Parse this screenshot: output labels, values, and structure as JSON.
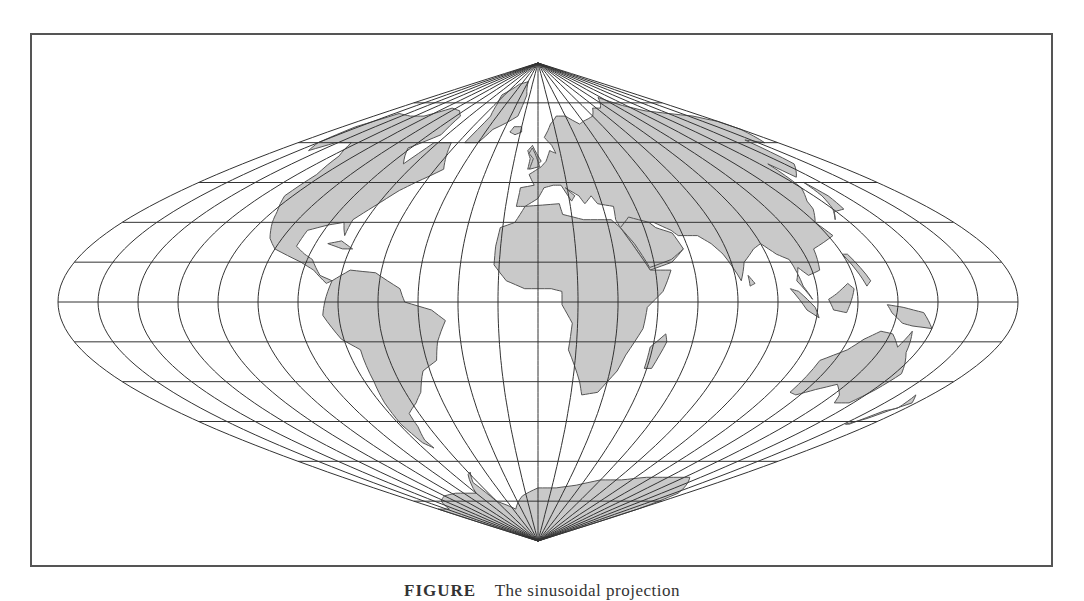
{
  "figure": {
    "projection": "sinusoidal",
    "caption_label": "FIGURE",
    "caption_text": "The sinusoidal projection"
  },
  "map": {
    "center_x": 538,
    "equator_y": 302,
    "half_width": 480,
    "half_height": 239,
    "graticule_step_deg": 15,
    "colors": {
      "background": "#ffffff",
      "land_fill": "#c9c9c9",
      "land_stroke": "#555555",
      "graticule": "#333333",
      "frame": "#555555"
    }
  },
  "continents": [
    {
      "name": "north-america",
      "coords": [
        [
          -168,
          66
        ],
        [
          -160,
          71
        ],
        [
          -140,
          70
        ],
        [
          -125,
          70
        ],
        [
          -110,
          73
        ],
        [
          -95,
          72
        ],
        [
          -85,
          70
        ],
        [
          -80,
          63
        ],
        [
          -92,
          58
        ],
        [
          -82,
          52
        ],
        [
          -78,
          60
        ],
        [
          -65,
          60
        ],
        [
          -60,
          55
        ],
        [
          -55,
          50
        ],
        [
          -65,
          45
        ],
        [
          -70,
          42
        ],
        [
          -76,
          36
        ],
        [
          -81,
          31
        ],
        [
          -80,
          25
        ],
        [
          -84,
          30
        ],
        [
          -90,
          29
        ],
        [
          -97,
          27
        ],
        [
          -97,
          21
        ],
        [
          -92,
          18
        ],
        [
          -88,
          16
        ],
        [
          -83,
          10
        ],
        [
          -78,
          8
        ],
        [
          -80,
          7
        ],
        [
          -86,
          12
        ],
        [
          -92,
          15
        ],
        [
          -105,
          20
        ],
        [
          -110,
          24
        ],
        [
          -115,
          30
        ],
        [
          -118,
          34
        ],
        [
          -124,
          40
        ],
        [
          -124,
          48
        ],
        [
          -130,
          55
        ],
        [
          -140,
          60
        ],
        [
          -152,
          60
        ],
        [
          -158,
          57
        ],
        [
          -165,
          60
        ],
        [
          -168,
          66
        ]
      ]
    },
    {
      "name": "greenland",
      "coords": [
        [
          -55,
          60
        ],
        [
          -45,
          60
        ],
        [
          -40,
          65
        ],
        [
          -22,
          70
        ],
        [
          -20,
          78
        ],
        [
          -30,
          83
        ],
        [
          -50,
          82
        ],
        [
          -65,
          78
        ],
        [
          -58,
          75
        ],
        [
          -52,
          70
        ],
        [
          -55,
          60
        ]
      ]
    },
    {
      "name": "south-america",
      "coords": [
        [
          -78,
          8
        ],
        [
          -72,
          12
        ],
        [
          -62,
          11
        ],
        [
          -52,
          5
        ],
        [
          -50,
          0
        ],
        [
          -40,
          -3
        ],
        [
          -35,
          -7
        ],
        [
          -39,
          -15
        ],
        [
          -41,
          -22
        ],
        [
          -48,
          -26
        ],
        [
          -53,
          -34
        ],
        [
          -58,
          -38
        ],
        [
          -65,
          -42
        ],
        [
          -66,
          -47
        ],
        [
          -69,
          -52
        ],
        [
          -68,
          -55
        ],
        [
          -72,
          -53
        ],
        [
          -74,
          -46
        ],
        [
          -73,
          -38
        ],
        [
          -71,
          -30
        ],
        [
          -70,
          -18
        ],
        [
          -76,
          -14
        ],
        [
          -81,
          -5
        ],
        [
          -80,
          0
        ],
        [
          -78,
          8
        ]
      ]
    },
    {
      "name": "eurasia",
      "coords": [
        [
          -10,
          36
        ],
        [
          -9,
          43
        ],
        [
          -2,
          44
        ],
        [
          -5,
          48
        ],
        [
          2,
          51
        ],
        [
          5,
          53
        ],
        [
          8,
          57
        ],
        [
          12,
          56
        ],
        [
          10,
          59
        ],
        [
          5,
          62
        ],
        [
          12,
          67
        ],
        [
          20,
          70
        ],
        [
          30,
          70
        ],
        [
          40,
          67
        ],
        [
          45,
          68
        ],
        [
          60,
          70
        ],
        [
          70,
          73
        ],
        [
          80,
          73
        ],
        [
          100,
          77
        ],
        [
          115,
          74
        ],
        [
          130,
          72
        ],
        [
          150,
          71
        ],
        [
          170,
          70
        ],
        [
          180,
          68
        ],
        [
          180,
          65
        ],
        [
          170,
          60
        ],
        [
          160,
          61
        ],
        [
          156,
          52
        ],
        [
          142,
          47
        ],
        [
          140,
          52
        ],
        [
          135,
          43
        ],
        [
          128,
          38
        ],
        [
          126,
          35
        ],
        [
          120,
          30
        ],
        [
          122,
          25
        ],
        [
          110,
          20
        ],
        [
          108,
          12
        ],
        [
          103,
          10
        ],
        [
          100,
          13
        ],
        [
          98,
          8
        ],
        [
          103,
          1
        ],
        [
          100,
          6
        ],
        [
          98,
          16
        ],
        [
          94,
          18
        ],
        [
          90,
          22
        ],
        [
          86,
          20
        ],
        [
          80,
          15
        ],
        [
          77,
          8
        ],
        [
          73,
          18
        ],
        [
          70,
          22
        ],
        [
          66,
          25
        ],
        [
          58,
          25
        ],
        [
          56,
          27
        ],
        [
          50,
          30
        ],
        [
          48,
          30
        ],
        [
          55,
          22
        ],
        [
          58,
          20
        ],
        [
          52,
          15
        ],
        [
          43,
          12
        ],
        [
          39,
          20
        ],
        [
          35,
          28
        ],
        [
          34,
          31
        ],
        [
          35,
          36
        ],
        [
          28,
          37
        ],
        [
          26,
          40
        ],
        [
          22,
          37
        ],
        [
          20,
          40
        ],
        [
          14,
          43
        ],
        [
          18,
          40
        ],
        [
          16,
          38
        ],
        [
          12,
          44
        ],
        [
          8,
          44
        ],
        [
          3,
          43
        ],
        [
          0,
          39
        ],
        [
          -6,
          36
        ],
        [
          -10,
          36
        ]
      ]
    },
    {
      "name": "scandinavia-britain",
      "coords": [
        [
          -6,
          50
        ],
        [
          -2,
          51
        ],
        [
          2,
          53
        ],
        [
          -2,
          57
        ],
        [
          -4,
          59
        ],
        [
          -7,
          57
        ],
        [
          -5,
          54
        ],
        [
          -6,
          50
        ]
      ]
    },
    {
      "name": "africa",
      "coords": [
        [
          -17,
          21
        ],
        [
          -16,
          28
        ],
        [
          -10,
          30
        ],
        [
          -6,
          36
        ],
        [
          10,
          37
        ],
        [
          11,
          33
        ],
        [
          20,
          31
        ],
        [
          32,
          31
        ],
        [
          35,
          28
        ],
        [
          39,
          20
        ],
        [
          43,
          12
        ],
        [
          51,
          12
        ],
        [
          47,
          4
        ],
        [
          41,
          -2
        ],
        [
          40,
          -10
        ],
        [
          35,
          -20
        ],
        [
          33,
          -26
        ],
        [
          27,
          -34
        ],
        [
          20,
          -35
        ],
        [
          18,
          -30
        ],
        [
          12,
          -18
        ],
        [
          13,
          -8
        ],
        [
          9,
          -1
        ],
        [
          9,
          4
        ],
        [
          5,
          5
        ],
        [
          -5,
          5
        ],
        [
          -12,
          8
        ],
        [
          -17,
          14
        ],
        [
          -17,
          21
        ]
      ]
    },
    {
      "name": "madagascar",
      "coords": [
        [
          44,
          -25
        ],
        [
          47,
          -25
        ],
        [
          50,
          -15
        ],
        [
          49,
          -12
        ],
        [
          44,
          -17
        ],
        [
          44,
          -25
        ]
      ]
    },
    {
      "name": "arabia",
      "coords": [
        [
          35,
          28
        ],
        [
          39,
          22
        ],
        [
          43,
          13
        ],
        [
          52,
          16
        ],
        [
          58,
          20
        ],
        [
          56,
          26
        ],
        [
          50,
          28
        ],
        [
          48,
          30
        ],
        [
          40,
          32
        ],
        [
          35,
          28
        ]
      ]
    },
    {
      "name": "australia",
      "coords": [
        [
          114,
          -22
        ],
        [
          114,
          -34
        ],
        [
          118,
          -35
        ],
        [
          124,
          -33
        ],
        [
          131,
          -31
        ],
        [
          138,
          -35
        ],
        [
          141,
          -38
        ],
        [
          148,
          -38
        ],
        [
          151,
          -33
        ],
        [
          153,
          -27
        ],
        [
          146,
          -19
        ],
        [
          143,
          -11
        ],
        [
          141,
          -17
        ],
        [
          136,
          -12
        ],
        [
          131,
          -11
        ],
        [
          126,
          -14
        ],
        [
          122,
          -18
        ],
        [
          114,
          -22
        ]
      ]
    },
    {
      "name": "new-guinea",
      "coords": [
        [
          131,
          -1
        ],
        [
          137,
          -2
        ],
        [
          145,
          -4
        ],
        [
          150,
          -10
        ],
        [
          142,
          -9
        ],
        [
          138,
          -8
        ],
        [
          133,
          -4
        ],
        [
          131,
          -1
        ]
      ]
    },
    {
      "name": "borneo",
      "coords": [
        [
          109,
          1
        ],
        [
          112,
          3
        ],
        [
          117,
          7
        ],
        [
          119,
          5
        ],
        [
          117,
          -1
        ],
        [
          116,
          -4
        ],
        [
          111,
          -3
        ],
        [
          109,
          1
        ]
      ]
    },
    {
      "name": "sumatra",
      "coords": [
        [
          95,
          5
        ],
        [
          98,
          4
        ],
        [
          104,
          -2
        ],
        [
          106,
          -6
        ],
        [
          101,
          -3
        ],
        [
          95,
          5
        ]
      ]
    },
    {
      "name": "japan",
      "coords": [
        [
          130,
          31
        ],
        [
          134,
          34
        ],
        [
          140,
          35
        ],
        [
          142,
          40
        ],
        [
          141,
          45
        ],
        [
          139,
          40
        ],
        [
          135,
          35
        ],
        [
          130,
          31
        ]
      ]
    },
    {
      "name": "new-zealand",
      "coords": [
        [
          166,
          -46
        ],
        [
          171,
          -44
        ],
        [
          174,
          -41
        ],
        [
          178,
          -38
        ],
        [
          173,
          -35
        ],
        [
          176,
          -40
        ],
        [
          172,
          -41
        ],
        [
          168,
          -46
        ],
        [
          166,
          -46
        ]
      ]
    },
    {
      "name": "antarctica",
      "coords": [
        [
          -180,
          -78
        ],
        [
          -160,
          -78
        ],
        [
          -140,
          -75
        ],
        [
          -120,
          -73
        ],
        [
          -100,
          -72
        ],
        [
          -75,
          -72
        ],
        [
          -62,
          -65
        ],
        [
          -58,
          -64
        ],
        [
          -65,
          -68
        ],
        [
          -60,
          -75
        ],
        [
          -40,
          -78
        ],
        [
          -20,
          -73
        ],
        [
          0,
          -70
        ],
        [
          20,
          -70
        ],
        [
          40,
          -69
        ],
        [
          60,
          -67
        ],
        [
          80,
          -67
        ],
        [
          100,
          -66
        ],
        [
          120,
          -66
        ],
        [
          140,
          -66
        ],
        [
          160,
          -70
        ],
        [
          170,
          -72
        ],
        [
          180,
          -78
        ],
        [
          180,
          -90
        ],
        [
          -180,
          -90
        ],
        [
          -180,
          -78
        ]
      ]
    },
    {
      "name": "uk",
      "coords": [
        [
          -5,
          50
        ],
        [
          1,
          51
        ],
        [
          0,
          53
        ],
        [
          -2,
          56
        ],
        [
          -4,
          58
        ],
        [
          -6,
          56
        ],
        [
          -3,
          54
        ],
        [
          -5,
          50
        ]
      ]
    },
    {
      "name": "iceland",
      "coords": [
        [
          -24,
          64
        ],
        [
          -22,
          66
        ],
        [
          -15,
          66
        ],
        [
          -14,
          64
        ],
        [
          -19,
          63
        ],
        [
          -24,
          64
        ]
      ]
    },
    {
      "name": "cuba",
      "coords": [
        [
          -85,
          22
        ],
        [
          -80,
          23
        ],
        [
          -74,
          20
        ],
        [
          -78,
          20
        ],
        [
          -85,
          22
        ]
      ]
    },
    {
      "name": "philippines",
      "coords": [
        [
          120,
          18
        ],
        [
          122,
          18
        ],
        [
          126,
          8
        ],
        [
          124,
          6
        ],
        [
          122,
          12
        ],
        [
          120,
          18
        ]
      ]
    },
    {
      "name": "sri-lanka",
      "coords": [
        [
          80,
          6
        ],
        [
          82,
          7
        ],
        [
          80,
          10
        ],
        [
          80,
          6
        ]
      ]
    }
  ]
}
